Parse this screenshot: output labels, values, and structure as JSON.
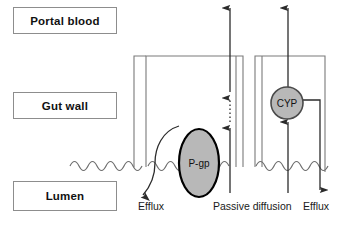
{
  "diagram": {
    "compartments": [
      {
        "id": "portal-blood",
        "label": "Portal blood"
      },
      {
        "id": "gut-wall",
        "label": "Gut wall"
      },
      {
        "id": "lumen",
        "label": "Lumen"
      }
    ],
    "proteins": [
      {
        "id": "pgp",
        "label": "P-gp",
        "shape": "ellipse",
        "fill": "#b8b8b8",
        "stroke": "#000000"
      },
      {
        "id": "cyp",
        "label": "CYP",
        "shape": "circle",
        "fill": "#b8b8b8",
        "stroke": "#4a4a4a"
      }
    ],
    "flow_labels": [
      {
        "id": "efflux-left",
        "label": "Efflux"
      },
      {
        "id": "passive",
        "label": "Passive diffusion"
      },
      {
        "id": "efflux-right",
        "label": "Efflux"
      }
    ],
    "colors": {
      "box_border": "#8d8d8d",
      "cell_wall": "#7a7a7a",
      "membrane": "#6e6e6e",
      "arrow": "#2b2b2b",
      "protein_fill": "#b8b8b8",
      "text": "#111111",
      "background": "#ffffff"
    },
    "arrows": [
      {
        "id": "pgp-efflux-arrow",
        "style": "curved",
        "direction": "down-left"
      },
      {
        "id": "passive-uptake-arrow",
        "style": "solid-then-dotted",
        "direction": "up"
      },
      {
        "id": "passive-portal-arrow",
        "style": "solid",
        "direction": "up"
      },
      {
        "id": "cyp-uptake-arrow",
        "style": "solid",
        "direction": "up"
      },
      {
        "id": "cyp-portal-arrow",
        "style": "solid",
        "direction": "up"
      },
      {
        "id": "cyp-efflux-arrow",
        "style": "elbow",
        "direction": "down"
      }
    ]
  }
}
